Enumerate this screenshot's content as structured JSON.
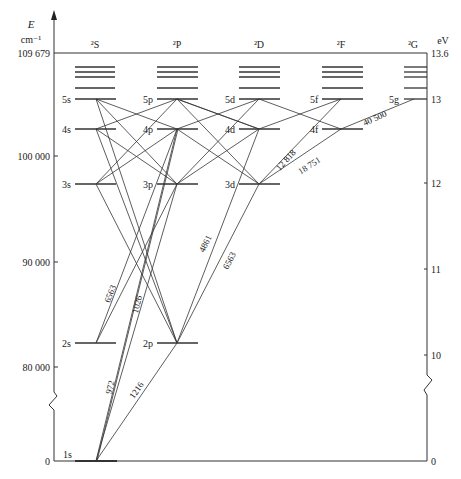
{
  "diagram": {
    "left_axis": {
      "symbol": "E",
      "unit": "cm⁻¹",
      "top_value": "109 679",
      "ticks": [
        {
          "label": "100 000",
          "y": 156
        },
        {
          "label": "90 000",
          "y": 262
        },
        {
          "label": "80 000",
          "y": 367
        },
        {
          "label": "0",
          "y": 461
        }
      ]
    },
    "right_axis": {
      "unit": "eV",
      "ticks": [
        {
          "label": "13.6",
          "y": 53
        },
        {
          "label": "13",
          "y": 99
        },
        {
          "label": "12",
          "y": 183
        },
        {
          "label": "11",
          "y": 269
        },
        {
          "label": "10",
          "y": 355
        },
        {
          "label": "0",
          "y": 461
        }
      ]
    },
    "series_headers": [
      {
        "label": "²S",
        "x": 95
      },
      {
        "label": "²P",
        "x": 177
      },
      {
        "label": "²D",
        "x": 259
      },
      {
        "label": "²F",
        "x": 341
      },
      {
        "label": "²G",
        "x": 414
      }
    ],
    "levels": [
      {
        "name": "1s",
        "col": 0,
        "y": 461
      },
      {
        "name": "2s",
        "col": 0,
        "y": 343
      },
      {
        "name": "3s",
        "col": 0,
        "y": 184
      },
      {
        "name": "4s",
        "col": 0,
        "y": 129
      },
      {
        "name": "5s",
        "col": 0,
        "y": 99
      },
      {
        "name": "2p",
        "col": 1,
        "y": 343
      },
      {
        "name": "3p",
        "col": 1,
        "y": 184
      },
      {
        "name": "4p",
        "col": 1,
        "y": 129
      },
      {
        "name": "5p",
        "col": 1,
        "y": 99
      },
      {
        "name": "3d",
        "col": 2,
        "y": 184
      },
      {
        "name": "4d",
        "col": 2,
        "y": 129
      },
      {
        "name": "5d",
        "col": 2,
        "y": 99
      },
      {
        "name": "4f",
        "col": 3,
        "y": 129
      },
      {
        "name": "5f",
        "col": 3,
        "y": 99
      },
      {
        "name": "5g",
        "col": 4,
        "y": 99
      }
    ],
    "wavelength_labels": [
      {
        "text": "6563",
        "x": 113,
        "y": 295,
        "rot": -70
      },
      {
        "text": "1026",
        "x": 138,
        "y": 307,
        "rot": -75
      },
      {
        "text": "972",
        "x": 112,
        "y": 388,
        "rot": -75
      },
      {
        "text": "1216",
        "x": 140,
        "y": 392,
        "rot": -52
      },
      {
        "text": "4861",
        "x": 209,
        "y": 245,
        "rot": -65
      },
      {
        "text": "6563",
        "x": 231,
        "y": 261,
        "rot": -62
      },
      {
        "text": "12 818",
        "x": 289,
        "y": 161,
        "rot": -47
      },
      {
        "text": "18 751",
        "x": 311,
        "y": 167,
        "rot": -33
      },
      {
        "text": "40 500",
        "x": 374,
        "y": 118,
        "rot": -25
      }
    ]
  }
}
